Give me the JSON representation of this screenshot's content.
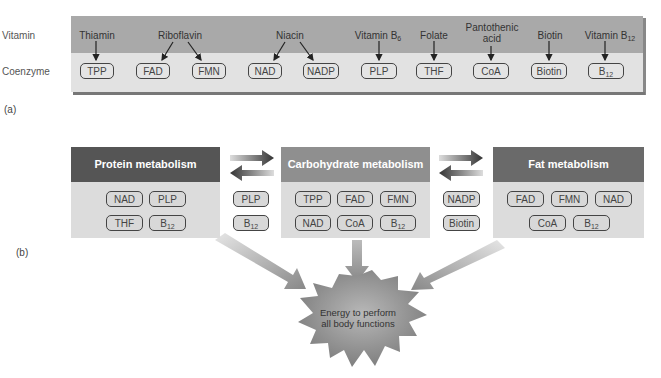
{
  "panel_a": {
    "label": "(a)",
    "row_labels": {
      "vitamin": "Vitamin",
      "coenzyme": "Coenzyme"
    },
    "vitamins": [
      {
        "name": "Thiamin",
        "coenzymes": [
          "TPP"
        ]
      },
      {
        "name": "Riboflavin",
        "coenzymes": [
          "FAD",
          "FMN"
        ]
      },
      {
        "name": "Niacin",
        "coenzymes": [
          "NAD",
          "NADP"
        ]
      },
      {
        "name": "Vitamin B",
        "sub": "6",
        "coenzymes": [
          "PLP"
        ]
      },
      {
        "name": "Folate",
        "coenzymes": [
          "THF"
        ]
      },
      {
        "name_line1": "Pantothenic",
        "name_line2": "acid",
        "coenzymes": [
          "CoA"
        ]
      },
      {
        "name": "Biotin",
        "coenzymes": [
          "Biotin"
        ]
      },
      {
        "name": "Vitamin B",
        "sub": "12",
        "coenzymes": [
          "B12"
        ]
      }
    ],
    "coenzyme_labels": {
      "tpp": "TPP",
      "fad": "FAD",
      "fmn": "FMN",
      "nad": "NAD",
      "nadp": "NADP",
      "plp": "PLP",
      "thf": "THF",
      "coa": "CoA",
      "biotin": "Biotin",
      "b": "B",
      "b_sub": "12"
    }
  },
  "panel_b": {
    "label": "(b)",
    "protein": {
      "title": "Protein metabolism",
      "coenzymes": [
        "NAD",
        "PLP",
        "THF",
        "B12"
      ]
    },
    "shared_protein_carb": [
      "PLP",
      "B12"
    ],
    "carbohydrate": {
      "title": "Carbohydrate metabolism",
      "coenzymes": [
        "TPP",
        "FAD",
        "FMN",
        "NAD",
        "CoA",
        "B12"
      ]
    },
    "shared_carb_fat": [
      "NADP",
      "Biotin"
    ],
    "fat": {
      "title": "Fat metabolism",
      "coenzymes": [
        "FAD",
        "FMN",
        "NAD",
        "CoA",
        "B12"
      ]
    },
    "energy": {
      "line1": "Energy to perform",
      "line2": "all body functions"
    }
  },
  "colors": {
    "banner_vitamin_row": "#a9a9a9",
    "banner_coenzyme_row": "#e2e2e2",
    "protein_header": "#555555",
    "carbohydrate_header": "#8f8f8f",
    "fat_header": "#6a6a6a",
    "box_body": "#dcdcdc",
    "starburst": "#8a8a8a"
  }
}
